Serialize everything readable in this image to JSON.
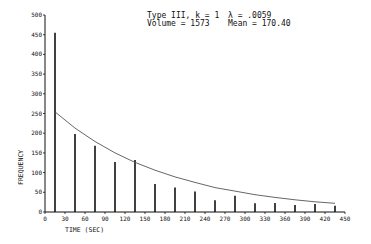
{
  "annotations": {
    "line1_left": "Type III, k = 1",
    "line1_right": "λ = .0059",
    "line2_left": "Volume = 1573",
    "line2_right": "Mean = 170.40"
  },
  "chart_data": {
    "type": "bar",
    "title": "",
    "xlabel": "TIME (SEC)",
    "ylabel": "FREQUENCY",
    "xlim": [
      0,
      450
    ],
    "ylim": [
      0,
      500
    ],
    "xticks": [
      0,
      30,
      60,
      90,
      120,
      150,
      180,
      210,
      240,
      270,
      300,
      330,
      360,
      390,
      420,
      450
    ],
    "yticks": [
      0,
      50,
      100,
      150,
      200,
      250,
      300,
      350,
      400,
      450,
      500
    ],
    "grid": false,
    "legend": null,
    "series": [
      {
        "name": "Observed frequency",
        "type": "bar",
        "x": [
          15,
          45,
          75,
          105,
          135,
          165,
          195,
          225,
          255,
          285,
          315,
          345,
          375,
          405,
          435
        ],
        "values": [
          455,
          198,
          168,
          127,
          132,
          71,
          62,
          52,
          30,
          41,
          22,
          23,
          18,
          20,
          16
        ]
      },
      {
        "name": "Fitted exponential (Type III, k = 1, λ = .0059)",
        "type": "line",
        "x": [
          15,
          45,
          75,
          105,
          135,
          165,
          195,
          225,
          255,
          285,
          315,
          345,
          375,
          405,
          435
        ],
        "values": [
          254,
          213,
          179,
          150,
          126,
          106,
          89,
          75,
          62,
          53,
          44,
          37,
          31,
          26,
          22
        ]
      }
    ],
    "annotations": [
      "Type III, k = 1",
      "λ = .0059",
      "Volume = 1573",
      "Mean = 170.40"
    ]
  },
  "colors": {
    "ink": "#111111",
    "curve": "#555555",
    "background": "#ffffff"
  }
}
